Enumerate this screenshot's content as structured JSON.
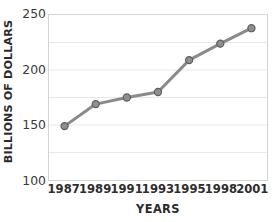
{
  "chart_data": {
    "type": "line",
    "title": "",
    "subtitle": "",
    "xlabel": "YEARS",
    "ylabel": "BILLIONS OF DOLLARS",
    "categories": [
      "1987",
      "1989",
      "1991",
      "1993",
      "1995",
      "1998",
      "2001"
    ],
    "values": [
      149,
      169,
      175,
      180,
      209,
      224,
      238
    ],
    "series": [
      {
        "name": "",
        "values": [
          149,
          169,
          175,
          180,
          209,
          224,
          238
        ]
      }
    ],
    "ylim": [
      100,
      250
    ],
    "y_major_ticks": [
      "100",
      "150",
      "200",
      "250"
    ],
    "y_major_tick_values": [
      100,
      150,
      200,
      250
    ],
    "y_minor_gridline_values": [
      125,
      175,
      225
    ],
    "grid": "horizontal",
    "legend": "none",
    "annotations": [],
    "colors": {
      "line": "#8a8a8a",
      "marker_fill": "#8f8f8f",
      "marker_edge": "#5e5e5e",
      "grid": "#e8e8e8",
      "axis_border": "#d4d4d4",
      "text": "#2b2b2b",
      "background": "#ffffff"
    }
  }
}
